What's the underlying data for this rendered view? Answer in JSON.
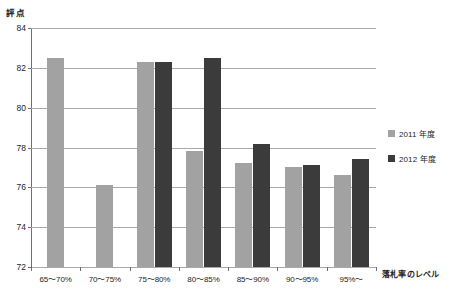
{
  "top_clipped_text": "",
  "axis_titles": {
    "y": "評点",
    "x": "落札率のレベル"
  },
  "legend": {
    "position": "right",
    "items": [
      {
        "label": "2011 年度",
        "color": "#a2a2a2"
      },
      {
        "label": "2012 年度",
        "color": "#3b3b3b"
      }
    ]
  },
  "colors": {
    "series_2011": "#a2a2a2",
    "series_2012": "#3b3b3b",
    "gridline": "#a8a8a8",
    "axis": "#6f6f6f",
    "text": "#1d1d1d",
    "background": "#ffffff"
  },
  "chart_data": {
    "type": "bar",
    "title": "",
    "subtitle": "",
    "xlabel": "落札率のレベル",
    "ylabel": "評点",
    "ylim": [
      72,
      84
    ],
    "yticks": [
      72,
      74,
      76,
      78,
      80,
      82,
      84
    ],
    "ytick_labels": [
      "72",
      "74",
      "76",
      "78",
      "80",
      "82",
      "84"
    ],
    "grid": true,
    "legend_position": "right",
    "categories": [
      "65〜70%",
      "70〜75%",
      "75〜80%",
      "80〜85%",
      "85〜90%",
      "90〜95%",
      "95%〜"
    ],
    "series": [
      {
        "name": "2011 年度",
        "color": "#a2a2a2",
        "values": [
          82.5,
          76.1,
          82.3,
          77.8,
          77.2,
          77.0,
          76.6
        ]
      },
      {
        "name": "2012 年度",
        "color": "#3b3b3b",
        "values": [
          null,
          null,
          82.3,
          82.5,
          78.2,
          77.1,
          77.4
        ]
      }
    ]
  }
}
